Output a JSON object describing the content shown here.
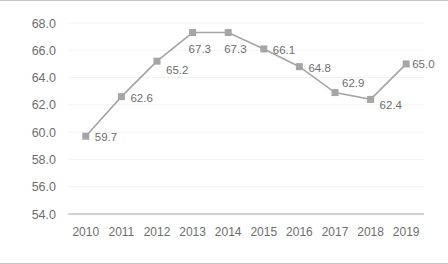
{
  "chart_data": {
    "type": "line",
    "title": "",
    "subtitle": "",
    "xlabel": "",
    "ylabel": "",
    "categories": [
      "2010",
      "2011",
      "2012",
      "2013",
      "2014",
      "2015",
      "2016",
      "2017",
      "2018",
      "2019"
    ],
    "values": [
      59.7,
      62.6,
      65.2,
      67.3,
      67.3,
      66.1,
      64.8,
      62.9,
      62.4,
      65.0
    ],
    "data_labels": [
      "59.7",
      "62.6",
      "65.2",
      "67.3",
      "67.3",
      "66.1",
      "64.8",
      "62.9",
      "62.4",
      "65.0"
    ],
    "ylim": [
      54.0,
      68.0
    ],
    "y_ticks": [
      54.0,
      56.0,
      58.0,
      60.0,
      62.0,
      64.0,
      66.0,
      68.0
    ],
    "y_tick_labels": [
      "54.0",
      "56.0",
      "58.0",
      "60.0",
      "62.0",
      "64.0",
      "66.0",
      "68.0"
    ],
    "y_tick_step": 2.0,
    "grid": true,
    "legend": "none",
    "series": [
      {
        "name": "",
        "values": [
          59.7,
          62.6,
          65.2,
          67.3,
          67.3,
          66.1,
          64.8,
          62.9,
          62.4,
          65.0
        ],
        "color": "#a5a5a5",
        "marker": "square"
      }
    ]
  },
  "style": {
    "line_color": "#a5a5a5",
    "marker_color": "#a5a5a5",
    "text_color": "#6e6e6e",
    "grid_color": "#f2f2f2",
    "axis_color": "#a6a6a6",
    "frame_border_color": "#c8c8c8",
    "background": "#ffffff"
  }
}
